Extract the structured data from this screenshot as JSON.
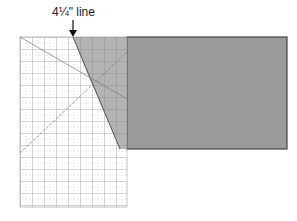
{
  "diagram": {
    "label": "4¼\" line",
    "colors": {
      "fabric": "#9a9a9a",
      "fabric_border": "#444444",
      "ruler_overlap": "#b9b9b9",
      "grid_line": "#777777",
      "arrow": "#111111"
    }
  }
}
